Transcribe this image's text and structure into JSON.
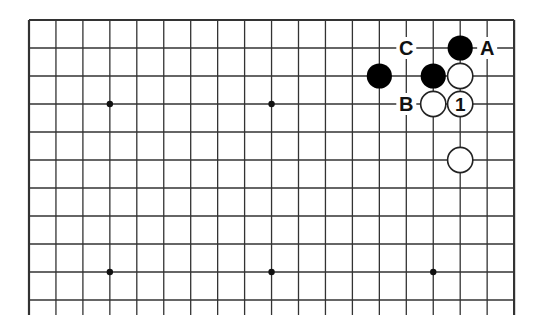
{
  "diagram": {
    "type": "go-board-partial",
    "columns": 19,
    "rows_visible": 11,
    "colors": {
      "background": "#ffffff",
      "line": "#333333",
      "black_stone": "#000000",
      "white_stone": "#ffffff",
      "label": "#111111"
    },
    "star_points": [
      {
        "col": 3,
        "row": 3
      },
      {
        "col": 9,
        "row": 3
      },
      {
        "col": 3,
        "row": 9
      },
      {
        "col": 9,
        "row": 9
      },
      {
        "col": 15,
        "row": 9
      }
    ],
    "stones": [
      {
        "col": 16,
        "row": 1,
        "color": "black",
        "label": ""
      },
      {
        "col": 13,
        "row": 2,
        "color": "black",
        "label": ""
      },
      {
        "col": 15,
        "row": 2,
        "color": "black",
        "label": ""
      },
      {
        "col": 16,
        "row": 2,
        "color": "white",
        "label": ""
      },
      {
        "col": 15,
        "row": 3,
        "color": "white",
        "label": ""
      },
      {
        "col": 16,
        "row": 3,
        "color": "white",
        "label": "1"
      },
      {
        "col": 16,
        "row": 5,
        "color": "white",
        "label": ""
      }
    ],
    "labels": [
      {
        "col": 17,
        "row": 1,
        "text": "A"
      },
      {
        "col": 14,
        "row": 3,
        "text": "B"
      },
      {
        "col": 14,
        "row": 1,
        "text": "C"
      }
    ]
  }
}
